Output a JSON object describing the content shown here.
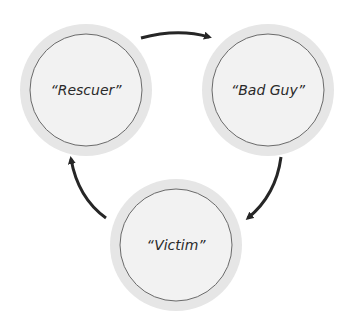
{
  "diagram": {
    "type": "cycle",
    "nodes": [
      {
        "id": "rescuer",
        "label": "“Rescuer”"
      },
      {
        "id": "bad_guy",
        "label": "“Bad Guy”"
      },
      {
        "id": "victim",
        "label": "“Victim”"
      }
    ],
    "edges": [
      {
        "from": "rescuer",
        "to": "bad_guy"
      },
      {
        "from": "bad_guy",
        "to": "victim"
      },
      {
        "from": "victim",
        "to": "rescuer"
      }
    ],
    "colors": {
      "ring_outer": "#e6e6e6",
      "ring_inner": "#f2f2f2",
      "ring_stroke": "#6a6a6a",
      "arrow": "#262626"
    }
  }
}
